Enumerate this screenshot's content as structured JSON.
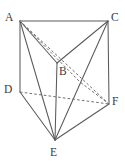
{
  "figure": {
    "name": "triangular-prism",
    "width": 125,
    "height": 166,
    "background_color": "#ffffff",
    "solid_stroke_color": "#5a5a5a",
    "dashed_stroke_color": "#6e6e6e"
  },
  "vertices": [
    {
      "id": "A",
      "label": "A",
      "x": 20,
      "y": 21,
      "label_x": 5,
      "label_y": 12
    },
    {
      "id": "C",
      "label": "C",
      "x": 108,
      "y": 21,
      "label_x": 111,
      "label_y": 12
    },
    {
      "id": "B",
      "label": "B",
      "x": 57,
      "y": 63,
      "label_x": 59,
      "label_y": 66
    },
    {
      "id": "D",
      "label": "D",
      "x": 20,
      "y": 92,
      "label_x": 4,
      "label_y": 84
    },
    {
      "id": "F",
      "label": "F",
      "x": 109,
      "y": 104,
      "label_x": 112,
      "label_y": 96
    },
    {
      "id": "E",
      "label": "E",
      "x": 55,
      "y": 140,
      "label_x": 50,
      "label_y": 147
    }
  ],
  "edges": [
    {
      "name": "edge-A-C",
      "from": "A",
      "to": "C",
      "style": "solid",
      "points": "20,21 108,21"
    },
    {
      "name": "edge-A-B",
      "from": "A",
      "to": "B",
      "style": "solid",
      "points": "20,21 57,63"
    },
    {
      "name": "edge-B-C",
      "from": "B",
      "to": "C",
      "style": "solid",
      "points": "57,63 108,21"
    },
    {
      "name": "edge-A-D",
      "from": "A",
      "to": "D",
      "style": "solid",
      "points": "20,21 20,92"
    },
    {
      "name": "edge-B-E",
      "from": "B",
      "to": "E",
      "style": "solid",
      "points": "57,63 55,140"
    },
    {
      "name": "edge-C-F",
      "from": "C",
      "to": "F",
      "style": "solid",
      "points": "108,21 109,104"
    },
    {
      "name": "edge-D-E",
      "from": "D",
      "to": "E",
      "style": "solid",
      "points": "20,92 55,140"
    },
    {
      "name": "edge-E-F",
      "from": "E",
      "to": "F",
      "style": "solid",
      "points": "55,140 109,104"
    },
    {
      "name": "edge-A-E",
      "from": "A",
      "to": "E",
      "style": "solid",
      "points": "20,21 55,140"
    },
    {
      "name": "edge-C-E",
      "from": "C",
      "to": "E",
      "style": "solid",
      "points": "108,21 55,140"
    },
    {
      "name": "edge-D-F",
      "from": "D",
      "to": "F",
      "style": "dashed",
      "points": "20,92 109,104"
    },
    {
      "name": "edge-A-F",
      "from": "A",
      "to": "F",
      "style": "dashed",
      "points": "20,21 109,104"
    },
    {
      "name": "edge-A-F-inner",
      "from": "A",
      "to": "F",
      "style": "dashed",
      "points": "20,21 80,82 109,104"
    }
  ]
}
